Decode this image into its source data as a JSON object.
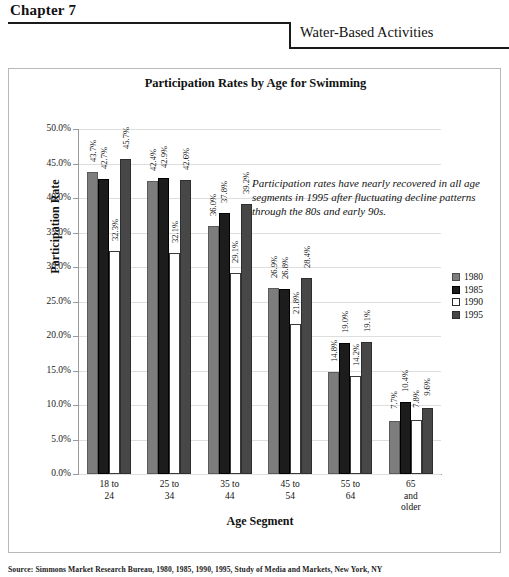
{
  "header": {
    "chapter": "Chapter 7",
    "section_title": "Water-Based Activities"
  },
  "source_note": "Source: Simmons Market Research Bureau, 1980, 1985, 1990, 1995, Study of Media and Markets, New York, NY",
  "annotation": "Participation rates have nearly recovered in all age segments in 1995 after fluctuating decline patterns through the 80s and early 90s.",
  "colors": {
    "series_1980": "#7d7d7d",
    "series_1985": "#1c1c1c",
    "series_1990": "#ffffff",
    "series_1995": "#474747",
    "gridline": "#dedede",
    "axis": "#9a9a9a"
  },
  "chart_data": {
    "type": "bar",
    "title": "Participation Rates by Age for Swimming",
    "xlabel": "Age Segment",
    "ylabel": "Participation Rate",
    "ylim": [
      0,
      50
    ],
    "ytick_labels": [
      "50.0%",
      "45.0%",
      "40.0%",
      "35.0%",
      "30.0%",
      "25.0%",
      "20.0%",
      "15.0%",
      "10.0%",
      "5.0%",
      "0.0%"
    ],
    "ytick_values": [
      50,
      45,
      40,
      35,
      30,
      25,
      20,
      15,
      10,
      5,
      0
    ],
    "grid": true,
    "legend_position": "right",
    "categories": [
      "18 to\n24",
      "25 to\n34",
      "35 to\n44",
      "45 to\n54",
      "55 to\n64",
      "65\nand\nolder"
    ],
    "category_lines": [
      [
        "18 to",
        "24"
      ],
      [
        "25 to",
        "34"
      ],
      [
        "35 to",
        "44"
      ],
      [
        "45 to",
        "54"
      ],
      [
        "55 to",
        "64"
      ],
      [
        "65",
        "and",
        "older"
      ]
    ],
    "series": [
      {
        "name": "1980",
        "values": [
          43.7,
          42.4,
          36.0,
          26.9,
          14.8,
          7.7
        ],
        "labels": [
          "43.7%",
          "42.4%",
          "36.0%",
          "26.9%",
          "14.8%",
          "7.7%"
        ]
      },
      {
        "name": "1985",
        "values": [
          42.7,
          42.9,
          37.8,
          26.8,
          19.0,
          10.4
        ],
        "labels": [
          "42.7%",
          "42.9%",
          "37.8%",
          "26.8%",
          "19.0%",
          "10.4%"
        ]
      },
      {
        "name": "1990",
        "values": [
          32.3,
          32.1,
          29.1,
          21.8,
          14.2,
          7.8
        ],
        "labels": [
          "32.3%",
          "32.1%",
          "29.1%",
          "21.8%",
          "14.2%",
          "7.8%"
        ]
      },
      {
        "name": "1995",
        "values": [
          45.7,
          42.6,
          39.2,
          28.4,
          19.1,
          9.6
        ],
        "labels": [
          "45.7%",
          "42.6%",
          "39.2%",
          "28.4%",
          "19.1%",
          "9.6%"
        ]
      }
    ]
  }
}
